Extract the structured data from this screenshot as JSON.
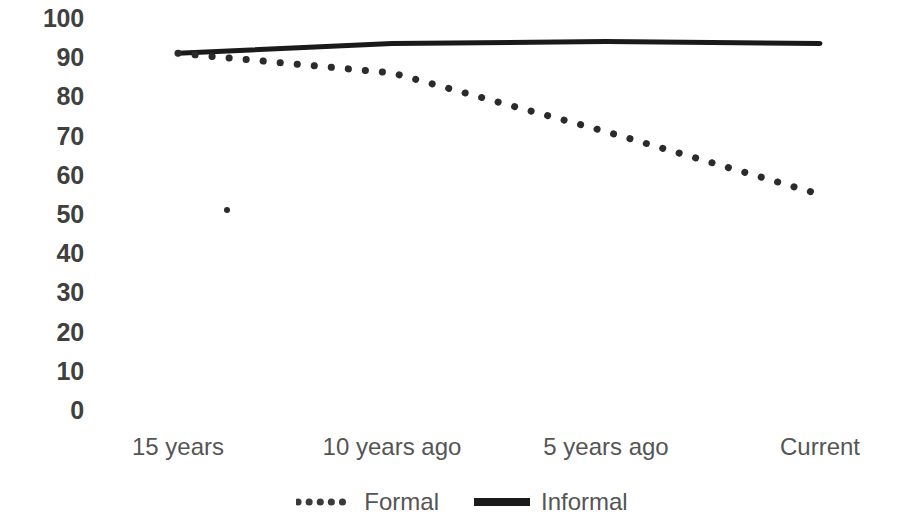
{
  "chart_data": {
    "type": "line",
    "title": "",
    "subtitle": "",
    "xlabel": "",
    "ylabel": "",
    "categories": [
      "15 years",
      "10 years ago",
      "5 years ago",
      "Current"
    ],
    "series": [
      {
        "name": "Formal",
        "style": "dotted",
        "color": "#2b2b2b",
        "values": [
          91,
          86,
          71,
          55
        ]
      },
      {
        "name": "Informal",
        "style": "solid",
        "color": "#1a1a1a",
        "values": [
          91,
          93.5,
          94,
          93.5
        ]
      }
    ],
    "ylim": [
      0,
      100
    ],
    "y_ticks": [
      "100",
      "90",
      "80",
      "70",
      "60",
      "50",
      "40",
      "30",
      "20",
      "10",
      "0"
    ],
    "y_tick_values": [
      100,
      90,
      80,
      70,
      60,
      50,
      40,
      30,
      20,
      10,
      0
    ],
    "grid": false,
    "legend_position": "bottom",
    "legend_entries": [
      "Formal",
      "Informal"
    ],
    "annotations": [
      {
        "name": "stray-mark",
        "x_px": 227,
        "value": 51
      }
    ]
  },
  "axes": {
    "y_axis_name": "y-axis",
    "x_axis_name": "x-axis"
  }
}
